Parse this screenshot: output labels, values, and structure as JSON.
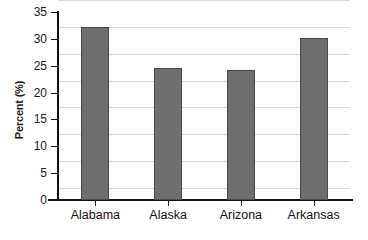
{
  "chart_data": {
    "type": "bar",
    "title": "",
    "xlabel": "",
    "ylabel": "Percent (%)",
    "categories": [
      "Alabama",
      "Alaska",
      "Arizona",
      "Arkansas"
    ],
    "values": [
      32.2,
      24.5,
      24.2,
      30.1
    ],
    "ylim": [
      0,
      35
    ],
    "ytick_step": 5,
    "yticks": [
      35,
      30,
      25,
      20,
      15,
      10,
      5,
      0
    ],
    "ytick_labels": [
      "35",
      "30",
      "25",
      "20",
      "15",
      "10",
      "5",
      "0"
    ],
    "grid": true,
    "legend": false,
    "bar_color": "#6e6e6e",
    "bar_border_color": "#4a4a4a",
    "axis_color": "#121212",
    "gridline_color": "#d8d8d8",
    "background_color": "#ffffff"
  }
}
